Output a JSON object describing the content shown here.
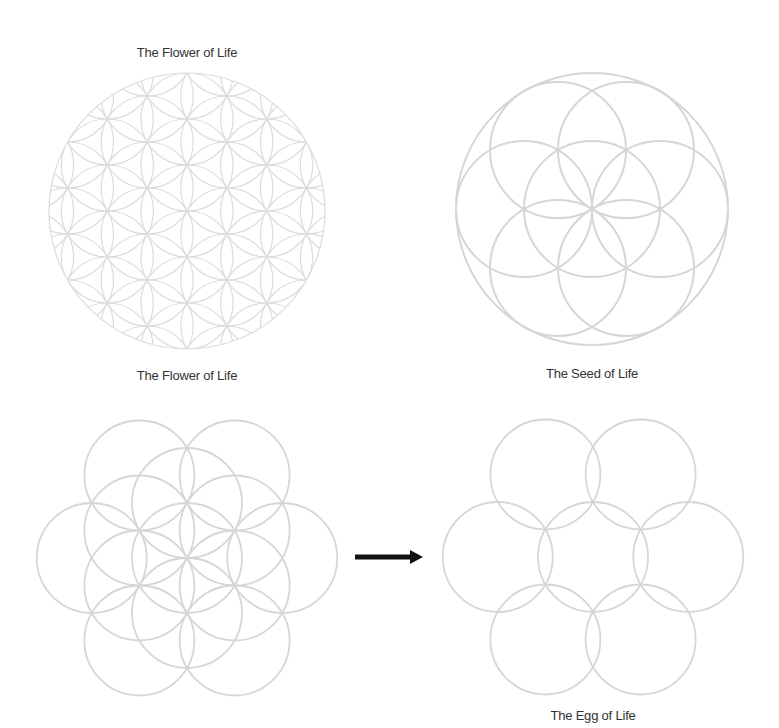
{
  "figures": [
    {
      "id": "flower-top",
      "label": "The Flower of Life",
      "label_pos": [
        187,
        45
      ],
      "center": [
        187,
        211
      ],
      "small_radius": 46,
      "outer_radius": 138,
      "pattern": "flower_of_life_19",
      "stroke": "#dcdcdc",
      "stroke_width": 1.2
    },
    {
      "id": "seed",
      "label": "The Seed of Life",
      "label_pos": [
        592,
        366
      ],
      "center": [
        592,
        209
      ],
      "small_radius": 68,
      "outer_radius": 136,
      "pattern": "seed_of_life",
      "stroke": "#d6d6d6",
      "stroke_width": 2
    },
    {
      "id": "flower-bottom",
      "label": "The Flower of Life",
      "label_pos": [
        187,
        368
      ],
      "center": [
        187,
        558
      ],
      "small_radius": 55,
      "pattern": "flower_13",
      "stroke": "#d6d6d6",
      "stroke_width": 1.8
    },
    {
      "id": "egg",
      "label": "The Egg of Life",
      "label_pos": [
        593,
        708
      ],
      "center": [
        593,
        557
      ],
      "small_radius": 55,
      "pattern": "egg_of_life",
      "stroke": "#d6d6d6",
      "stroke_width": 1.8
    }
  ],
  "arrow": {
    "x1": 355,
    "x2": 423,
    "y": 557,
    "color": "#111111",
    "icon": "right-arrow-icon"
  }
}
